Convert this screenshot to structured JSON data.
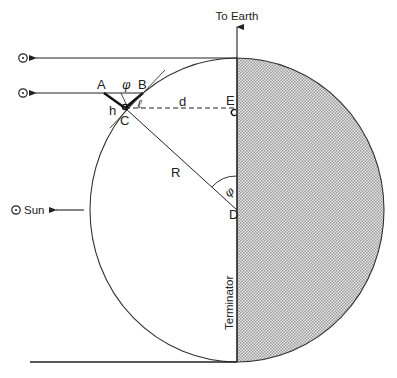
{
  "diagram": {
    "title_arrow_label": "To Earth",
    "sun_label": "Sun",
    "sun_symbol": "⊙",
    "terminator_label": "Terminator",
    "points": {
      "A": "A",
      "B": "B",
      "C": "C",
      "D": "D",
      "E": "E"
    },
    "segment_labels": {
      "h": "h",
      "l": "ℓ",
      "d": "d",
      "R": "R"
    },
    "angle_label": "φ",
    "colors": {
      "line": "#222222",
      "shade_fg": "#9a9a9a",
      "shade_bg": "#e6e6e6",
      "background": "#ffffff"
    }
  }
}
